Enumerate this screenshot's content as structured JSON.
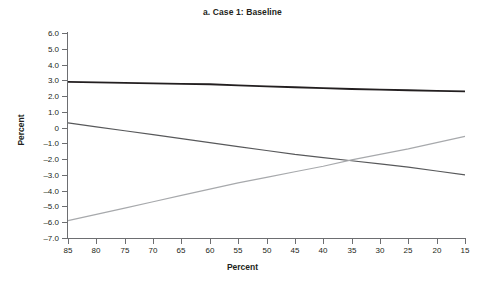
{
  "chart_data": {
    "type": "line",
    "title": "a. Case 1: Baseline",
    "xlabel": "Percent",
    "ylabel": "Percent",
    "grid": false,
    "legend": "none",
    "xlim": [
      85,
      15
    ],
    "ylim": [
      -7.0,
      6.0
    ],
    "x_axis_reversed": true,
    "xticks": [
      85,
      80,
      75,
      70,
      65,
      60,
      55,
      50,
      45,
      40,
      35,
      30,
      25,
      20,
      15
    ],
    "xtick_labels": [
      "85",
      "80",
      "75",
      "70",
      "65",
      "60",
      "55",
      "50",
      "45",
      "40",
      "35",
      "30",
      "25",
      "20",
      "15"
    ],
    "yticks": [
      6.0,
      5.0,
      4.0,
      3.0,
      2.0,
      1.0,
      0,
      -1.0,
      -2.0,
      -3.0,
      -4.0,
      -5.0,
      -6.0,
      -7.0
    ],
    "ytick_labels": [
      "6.0",
      "5.0",
      "4.0",
      "3.0",
      "2.0",
      "1.0",
      "0",
      "–1.0",
      "–2.0",
      "–3.0",
      "–4.0",
      "–5.0",
      "–6.0",
      "–7.0"
    ],
    "x": [
      85,
      80,
      75,
      70,
      65,
      60,
      55,
      50,
      45,
      40,
      35,
      30,
      25,
      20,
      15
    ],
    "series": [
      {
        "name": "top-flat-line",
        "color": "#231f20",
        "width": 1.8,
        "values": [
          2.9,
          2.87,
          2.84,
          2.81,
          2.78,
          2.75,
          2.68,
          2.62,
          2.56,
          2.5,
          2.45,
          2.41,
          2.37,
          2.33,
          2.3
        ]
      },
      {
        "name": "descending-line",
        "color": "#58595b",
        "width": 1.2,
        "values": [
          0.3,
          0.05,
          -0.2,
          -0.45,
          -0.7,
          -0.95,
          -1.2,
          -1.45,
          -1.7,
          -1.9,
          -2.1,
          -2.3,
          -2.5,
          -2.75,
          -3.0
        ]
      },
      {
        "name": "ascending-line",
        "color": "#a7a9ac",
        "width": 1.2,
        "values": [
          -5.9,
          -5.5,
          -5.1,
          -4.7,
          -4.3,
          -3.9,
          -3.5,
          -3.15,
          -2.8,
          -2.45,
          -2.05,
          -1.7,
          -1.35,
          -0.95,
          -0.55
        ]
      }
    ],
    "annotations": [
      {
        "text": "descending and ascending series intersect near x=35, y=-2.0"
      }
    ]
  }
}
